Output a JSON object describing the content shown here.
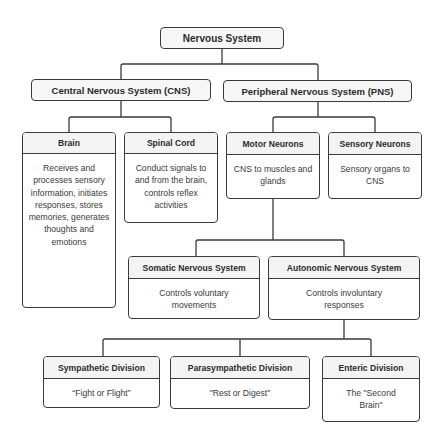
{
  "diagram": {
    "root": {
      "title": "Nervous System"
    },
    "level1": [
      {
        "title": "Central Nervous System (CNS)"
      },
      {
        "title": "Peripheral Nervous System (PNS)"
      }
    ],
    "cns_children": [
      {
        "title": "Brain",
        "desc": "Receives and processes sensory information, initiates responses, stores memories, generates thoughts and emotions"
      },
      {
        "title": "Spinal Cord",
        "desc": "Conduct signals to and from the brain, controls reflex activities"
      }
    ],
    "pns_children": [
      {
        "title": "Motor Neurons",
        "desc": "CNS to muscles and glands"
      },
      {
        "title": "Sensory Neurons",
        "desc": "Sensory organs to CNS"
      }
    ],
    "motor_children": [
      {
        "title": "Somatic Nervous System",
        "desc": "Controls voluntary movements"
      },
      {
        "title": "Autonomic Nervous System",
        "desc": "Controls involuntary responses"
      }
    ],
    "autonomic_children": [
      {
        "title": "Sympathetic Division",
        "desc": "“Fight or Flight”"
      },
      {
        "title": "Parasympathetic Division",
        "desc": "\"Rest or Digest\""
      },
      {
        "title": "Enteric Division",
        "desc": "The \"Second Brain\""
      }
    ]
  },
  "colors": {
    "border": "#3a3a3a",
    "header_bg": "#f3f3f3",
    "connector": "#3a3a3a"
  }
}
